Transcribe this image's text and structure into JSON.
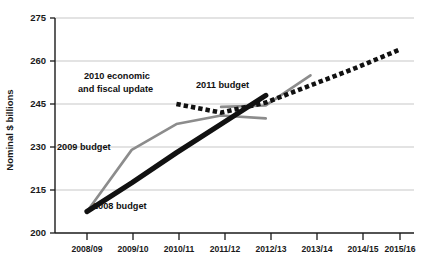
{
  "chart_data": {
    "type": "line",
    "title": "",
    "xlabel": "",
    "ylabel": "Nominal $ billions",
    "categories": [
      "2008/09",
      "2009/10",
      "2010/11",
      "2011/12",
      "2012/13",
      "2013/14",
      "2014/15",
      "2015/16"
    ],
    "ylim": [
      200,
      275
    ],
    "yticks": [
      200,
      215,
      230,
      245,
      260,
      275
    ],
    "grid": true,
    "legend": "inline-annotations",
    "series": [
      {
        "name": "2008 budget",
        "style": "thick-solid-black",
        "color": "#111111",
        "x": [
          "2008/09",
          "2009/10",
          "2010/11",
          "2011/12",
          "2012/13"
        ],
        "values": [
          207.5,
          217.5,
          228.0,
          238.0,
          248.0
        ]
      },
      {
        "name": "2009 budget",
        "style": "medium-solid-gray",
        "color": "#8c8c8c",
        "x": [
          "2008/09",
          "2009/10",
          "2010/11",
          "2011/12",
          "2012/13"
        ],
        "values": [
          207.5,
          229.0,
          238.0,
          241.0,
          240.0
        ]
      },
      {
        "name": "2010 economic and fiscal update",
        "style": "thick-dotted-black",
        "color": "#111111",
        "x": [
          "2010/11",
          "2011/12",
          "2012/13",
          "2013/14",
          "2014/15",
          "2015/16"
        ],
        "values": [
          245.0,
          242.0,
          245.5,
          251.5,
          257.5,
          264.0
        ]
      },
      {
        "name": "2011 budget",
        "style": "medium-solid-gray",
        "color": "#8c8c8c",
        "x": [
          "2011/12",
          "2012/13",
          "2013/14"
        ],
        "values": [
          244.0,
          244.5,
          255.0
        ]
      }
    ],
    "annotations": [
      {
        "text": "2010 economic",
        "series": "2010 economic and fiscal update"
      },
      {
        "text": "and fiscal update",
        "series": "2010 economic and fiscal update"
      },
      {
        "text": "2011 budget",
        "series": "2011 budget"
      },
      {
        "text": "2009 budget",
        "series": "2009 budget"
      },
      {
        "text": "2008 budget",
        "series": "2008 budget"
      }
    ]
  },
  "axis": {
    "y_title": "Nominal $ billions",
    "y_tick_labels": [
      "275",
      "260",
      "245",
      "230",
      "215",
      "200"
    ],
    "x_tick_labels": [
      "2008/09",
      "2009/10",
      "2010/11",
      "2011/12",
      "2012/13",
      "2013/14",
      "2014/15",
      "2015/16"
    ]
  },
  "labels": {
    "l_2010_line1": "2010 economic",
    "l_2010_line2": "and fiscal update",
    "l_2011": "2011 budget",
    "l_2009": "2009 budget",
    "l_2008": "2008 budget"
  },
  "colors": {
    "gray_series": "#8c8c8c",
    "black_series": "#111111",
    "gridline": "#b9b9b9",
    "axis": "#1a1a1a",
    "background": "#ffffff"
  }
}
